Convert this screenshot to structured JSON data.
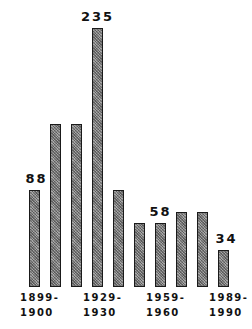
{
  "chart_data": {
    "type": "bar",
    "title": "",
    "xlabel": "",
    "ylabel": "",
    "categories": [
      "1899-1900",
      "1909-1910",
      "1919-1920",
      "1929-1930",
      "1939-1940",
      "1949-1950",
      "1959-1960",
      "1969-1970",
      "1979-1980",
      "1989-1990"
    ],
    "values": [
      88,
      148,
      148,
      235,
      88,
      58,
      58,
      68,
      68,
      34
    ],
    "data_labels": [
      {
        "index": 0,
        "text": "88"
      },
      {
        "index": 3,
        "text": "235"
      },
      {
        "index": 6,
        "text": "58"
      },
      {
        "index": 9,
        "text": "34"
      }
    ],
    "tick_labels": [
      {
        "index": 0,
        "line1": "1899-",
        "line2": "1900"
      },
      {
        "index": 3,
        "line1": "1929-",
        "line2": "1930"
      },
      {
        "index": 6,
        "line1": "1959-",
        "line2": "1960"
      },
      {
        "index": 9,
        "line1": "1989-",
        "line2": "1990"
      }
    ],
    "grid": false,
    "legend": null,
    "ylim": [
      0,
      240
    ]
  },
  "colors": {
    "bar_fill": "#8a8a8a",
    "bar_border": "#1a1a1a",
    "text": "#111111"
  }
}
